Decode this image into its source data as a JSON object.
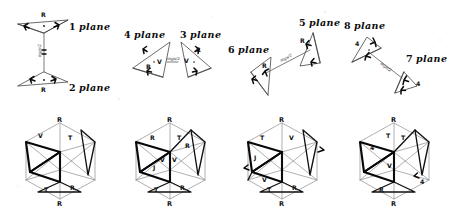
{
  "figure": {
    "title_visible": false,
    "background_color": "#ffffff",
    "ink_color": "#0c0c0c",
    "bold_ink_color": "#080808",
    "faint_ink_color": "#8d8d8d",
    "width": 455,
    "height": 208
  },
  "top_row": {
    "groups": [
      {
        "id": "group-1-2",
        "arrangement": "vertical-pair",
        "labels": [
          {
            "name": "plane-label-1",
            "number": "1",
            "word": "plane",
            "text": "1 plane"
          },
          {
            "name": "plane-label-2",
            "number": "2",
            "word": "plane",
            "text": "2 plane"
          }
        ],
        "connector_annotation": "mgs/2",
        "vertex_marks": [
          "R",
          "R"
        ],
        "apex_labels": [
          "R",
          "R"
        ]
      },
      {
        "id": "group-4-3",
        "arrangement": "horizontal-pair",
        "labels": [
          {
            "name": "plane-label-4",
            "number": "4",
            "word": "plane",
            "text": "4 plane"
          },
          {
            "name": "plane-label-3",
            "number": "3",
            "word": "plane",
            "text": "3 plane"
          }
        ],
        "connector_annotation": "mgs/2",
        "vertex_marks": [
          "V",
          "R",
          "V",
          "R"
        ]
      },
      {
        "id": "group-6-5",
        "arrangement": "diagonal-pair",
        "labels": [
          {
            "name": "plane-label-6",
            "number": "6",
            "word": "plane",
            "text": "6 plane"
          },
          {
            "name": "plane-label-5",
            "number": "5",
            "word": "plane",
            "text": "5 plane"
          }
        ],
        "connector_annotation": "mgs/2",
        "vertex_marks": [
          "R",
          "R"
        ]
      },
      {
        "id": "group-8-7",
        "arrangement": "diagonal-pair",
        "labels": [
          {
            "name": "plane-label-8",
            "number": "8",
            "word": "plane",
            "text": "8 plane"
          },
          {
            "name": "plane-label-7",
            "number": "7",
            "word": "plane",
            "text": "7 plane"
          }
        ],
        "connector_annotation": "mgs/2",
        "vertex_marks": [
          "4",
          "4",
          "4",
          "4"
        ]
      }
    ]
  },
  "bottom_row": {
    "caption_visible": false,
    "figures": [
      {
        "id": "icosahedron-1",
        "name": "icosahedron-projection-1",
        "top_label": "R",
        "bottom_label": "R",
        "vertex_labels": [
          "V",
          "T",
          "T",
          "R"
        ],
        "highlighted_faces": 2
      },
      {
        "id": "icosahedron-2",
        "name": "icosahedron-projection-2",
        "top_label": "R",
        "bottom_label": "R",
        "vertex_labels": [
          "V",
          "V",
          "T",
          "R",
          "R",
          "J",
          "T",
          "R"
        ],
        "highlighted_faces": 3
      },
      {
        "id": "icosahedron-3",
        "name": "icosahedron-projection-3",
        "top_label": "R",
        "bottom_label": "R",
        "vertex_labels": [
          "V",
          "T",
          "J",
          "V",
          "T",
          "R"
        ],
        "highlighted_faces": 3
      },
      {
        "id": "icosahedron-4",
        "name": "icosahedron-projection-4",
        "top_label": "R",
        "bottom_label": "R",
        "vertex_labels": [
          "V",
          "T",
          "T",
          "4",
          "R",
          "4"
        ],
        "highlighted_faces": 3
      }
    ]
  }
}
